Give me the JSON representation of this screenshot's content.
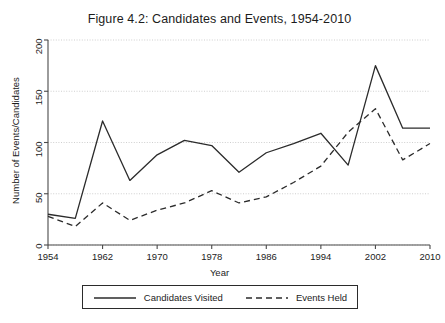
{
  "chart_data": {
    "type": "line",
    "title": "Figure 4.2: Candidates and Events, 1954-2010",
    "xlabel": "Year",
    "ylabel": "Number of Events/Candidates",
    "xlim": [
      1954,
      2010
    ],
    "ylim": [
      0,
      200
    ],
    "xticks": [
      1954,
      1962,
      1970,
      1978,
      1986,
      1994,
      2002,
      2010
    ],
    "yticks": [
      0,
      50,
      100,
      150,
      200
    ],
    "grid": true,
    "legend_position": "below",
    "x": [
      1954,
      1958,
      1962,
      1966,
      1970,
      1974,
      1978,
      1982,
      1986,
      1990,
      1994,
      1998,
      2002,
      2006,
      2010
    ],
    "series": [
      {
        "name": "Candidates Visited",
        "style": "solid",
        "color": "#2b2b2b",
        "values": [
          30,
          26,
          121,
          63,
          88,
          102,
          97,
          71,
          90,
          99,
          109,
          78,
          175,
          114,
          114
        ]
      },
      {
        "name": "Events Held",
        "style": "dashed",
        "color": "#2b2b2b",
        "values": [
          28,
          18,
          41,
          24,
          34,
          41,
          53,
          41,
          47,
          61,
          77,
          110,
          133,
          83,
          99
        ]
      }
    ]
  },
  "legend": {
    "entries": [
      {
        "label": "Candidates Visited",
        "style": "solid"
      },
      {
        "label": "Events Held",
        "style": "dashed"
      }
    ]
  }
}
